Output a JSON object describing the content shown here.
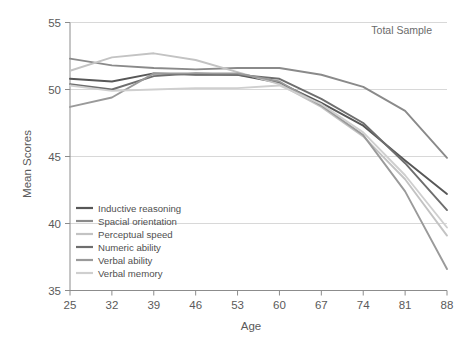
{
  "chart_data": {
    "type": "line",
    "title": "",
    "annotation": "Total Sample",
    "xlabel": "Age",
    "ylabel": "Mean Scores",
    "x": [
      25,
      32,
      39,
      46,
      53,
      60,
      67,
      74,
      81,
      88
    ],
    "categories": [
      "25",
      "32",
      "39",
      "46",
      "53",
      "60",
      "67",
      "74",
      "81",
      "88"
    ],
    "xlim": [
      25,
      88
    ],
    "ylim": [
      35,
      55
    ],
    "yticks": [
      35,
      40,
      45,
      50,
      55
    ],
    "xticks": [
      25,
      32,
      39,
      46,
      53,
      60,
      67,
      74,
      81,
      88
    ],
    "grid": "horizontal",
    "legend_position": "lower-left-inside",
    "series": [
      {
        "name": "Inductive reasoning",
        "color": "#575757",
        "values": [
          50.8,
          50.6,
          51.2,
          51.1,
          51.1,
          50.5,
          49.0,
          47.3,
          44.7,
          42.2
        ]
      },
      {
        "name": "Spacial orientation",
        "color": "#8a8a8a",
        "values": [
          52.3,
          51.8,
          51.6,
          51.5,
          51.6,
          51.6,
          51.1,
          50.2,
          48.4,
          44.9
        ]
      },
      {
        "name": "Perceptual speed",
        "color": "#c3c3c3",
        "values": [
          51.4,
          52.4,
          52.7,
          52.2,
          51.3,
          50.4,
          48.7,
          46.5,
          43.3,
          39.1
        ]
      },
      {
        "name": "Numeric ability",
        "color": "#6e6e6e",
        "values": [
          50.4,
          50.0,
          51.0,
          51.2,
          51.1,
          50.8,
          49.3,
          47.5,
          44.5,
          41.0
        ]
      },
      {
        "name": "Verbal ability",
        "color": "#9a9a9a",
        "values": [
          48.7,
          49.4,
          51.2,
          51.2,
          51.2,
          50.6,
          48.8,
          46.6,
          42.4,
          36.6
        ]
      },
      {
        "name": "Verbal memory",
        "color": "#cfcfcf",
        "values": [
          50.3,
          49.9,
          50.0,
          50.1,
          50.1,
          50.3,
          48.9,
          46.8,
          43.6,
          39.7
        ]
      }
    ]
  },
  "legend": {
    "items": [
      {
        "label": "Inductive reasoning"
      },
      {
        "label": "Spacial orientation"
      },
      {
        "label": "Perceptual speed"
      },
      {
        "label": "Numeric ability"
      },
      {
        "label": "Verbal ability"
      },
      {
        "label": "Verbal memory"
      }
    ]
  },
  "axes": {
    "y_title": "Mean Scores",
    "x_title": "Age",
    "y_ticklabels": [
      "55",
      "50",
      "45",
      "40",
      "35"
    ],
    "x_ticklabels": [
      "25",
      "32",
      "39",
      "46",
      "53",
      "60",
      "67",
      "74",
      "81",
      "88"
    ]
  },
  "annotation": {
    "text": "Total Sample"
  },
  "colors": {
    "grid": "#d8d8d8",
    "axis": "#8c8c8c",
    "text": "#5a5a5a",
    "background": "#ffffff"
  }
}
